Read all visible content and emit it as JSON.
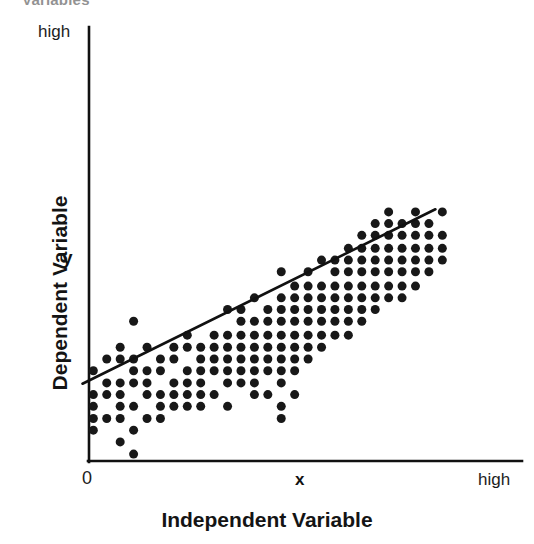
{
  "figure": {
    "clipped_title": "Variables",
    "y_top_label": "high",
    "y_mid_label": "y",
    "y_axis_title": "Dependent Variable",
    "x_zero_label": "0",
    "x_mid_label": "x",
    "x_high_label": "high",
    "x_axis_title": "Independent Variable"
  },
  "colors": {
    "point": "#181818",
    "axis": "#111111",
    "trendline": "#111111",
    "background": "#ffffff",
    "text": "#141414"
  },
  "chart_data": {
    "type": "scatter",
    "title": "Variables",
    "xlabel": "Independent Variable",
    "ylabel": "Dependent Variable",
    "xlim": [
      0,
      100
    ],
    "ylim": [
      0,
      100
    ],
    "xticks": [
      0,
      55,
      100
    ],
    "xticklabels": [
      "0",
      "x",
      "high"
    ],
    "yticks": [
      100
    ],
    "yticklabels": [
      "high"
    ],
    "grid": false,
    "legend": null,
    "annotations": [
      {
        "text": "x",
        "axis": "x",
        "position": 55,
        "bold": true
      },
      {
        "text": "y",
        "axis": "y",
        "position": 66,
        "bold": true
      }
    ],
    "trendline": {
      "type": "linear",
      "x": [
        -1.5,
        80.0
      ],
      "y": [
        17.8,
        58.0
      ],
      "slope": 0.49,
      "intercept": 18.5
    },
    "point_marker": {
      "shape": "circle",
      "size_px": 9,
      "color": "#181818"
    },
    "n_points": 173,
    "points": [
      [
        1.0,
        20.8
      ],
      [
        1.0,
        15.3
      ],
      [
        1.0,
        12.6
      ],
      [
        1.0,
        9.8
      ],
      [
        1.0,
        7.1
      ],
      [
        4.1,
        23.5
      ],
      [
        4.1,
        18.0
      ],
      [
        4.1,
        15.3
      ],
      [
        4.1,
        9.8
      ],
      [
        7.2,
        26.2
      ],
      [
        7.2,
        23.5
      ],
      [
        7.2,
        18.0
      ],
      [
        7.2,
        15.3
      ],
      [
        7.2,
        12.6
      ],
      [
        7.2,
        9.8
      ],
      [
        7.2,
        4.4
      ],
      [
        10.3,
        32.2
      ],
      [
        10.3,
        23.5
      ],
      [
        10.3,
        20.8
      ],
      [
        10.3,
        18.0
      ],
      [
        10.3,
        12.6
      ],
      [
        10.3,
        7.1
      ],
      [
        10.3,
        1.6
      ],
      [
        13.4,
        26.2
      ],
      [
        13.4,
        20.8
      ],
      [
        13.4,
        18.0
      ],
      [
        13.4,
        15.3
      ],
      [
        13.4,
        9.8
      ],
      [
        16.5,
        23.5
      ],
      [
        16.5,
        20.8
      ],
      [
        16.5,
        15.3
      ],
      [
        16.5,
        12.6
      ],
      [
        16.5,
        9.8
      ],
      [
        19.6,
        26.2
      ],
      [
        19.6,
        23.5
      ],
      [
        19.6,
        18.0
      ],
      [
        19.6,
        15.3
      ],
      [
        19.6,
        12.6
      ],
      [
        22.7,
        29.0
      ],
      [
        22.7,
        26.2
      ],
      [
        22.7,
        20.8
      ],
      [
        22.7,
        18.0
      ],
      [
        22.7,
        15.3
      ],
      [
        22.7,
        12.6
      ],
      [
        25.8,
        26.2
      ],
      [
        25.8,
        23.5
      ],
      [
        25.8,
        20.8
      ],
      [
        25.8,
        18.0
      ],
      [
        25.8,
        15.3
      ],
      [
        25.8,
        12.6
      ],
      [
        28.9,
        29.0
      ],
      [
        28.9,
        26.2
      ],
      [
        28.9,
        23.5
      ],
      [
        28.9,
        20.8
      ],
      [
        28.9,
        15.3
      ],
      [
        32.0,
        34.9
      ],
      [
        32.0,
        29.0
      ],
      [
        32.0,
        26.2
      ],
      [
        32.0,
        23.5
      ],
      [
        32.0,
        20.8
      ],
      [
        32.0,
        18.0
      ],
      [
        32.0,
        12.6
      ],
      [
        35.1,
        34.9
      ],
      [
        35.1,
        32.2
      ],
      [
        35.1,
        29.0
      ],
      [
        35.1,
        26.2
      ],
      [
        35.1,
        23.5
      ],
      [
        35.1,
        20.8
      ],
      [
        35.1,
        18.0
      ],
      [
        38.2,
        37.6
      ],
      [
        38.2,
        32.2
      ],
      [
        38.2,
        29.0
      ],
      [
        38.2,
        26.2
      ],
      [
        38.2,
        23.5
      ],
      [
        38.2,
        20.8
      ],
      [
        38.2,
        18.0
      ],
      [
        38.2,
        15.3
      ],
      [
        41.3,
        34.9
      ],
      [
        41.3,
        32.2
      ],
      [
        41.3,
        29.0
      ],
      [
        41.3,
        26.2
      ],
      [
        41.3,
        23.5
      ],
      [
        41.3,
        20.8
      ],
      [
        41.3,
        15.3
      ],
      [
        44.4,
        43.6
      ],
      [
        44.4,
        37.6
      ],
      [
        44.4,
        34.9
      ],
      [
        44.4,
        32.2
      ],
      [
        44.4,
        29.0
      ],
      [
        44.4,
        26.2
      ],
      [
        44.4,
        23.5
      ],
      [
        44.4,
        20.8
      ],
      [
        44.4,
        18.0
      ],
      [
        44.4,
        12.6
      ],
      [
        44.4,
        9.8
      ],
      [
        47.5,
        40.3
      ],
      [
        47.5,
        37.6
      ],
      [
        47.5,
        34.9
      ],
      [
        47.5,
        32.2
      ],
      [
        47.5,
        29.0
      ],
      [
        47.5,
        26.2
      ],
      [
        47.5,
        23.5
      ],
      [
        47.5,
        20.8
      ],
      [
        47.5,
        15.3
      ],
      [
        50.6,
        43.6
      ],
      [
        50.6,
        40.3
      ],
      [
        50.6,
        37.6
      ],
      [
        50.6,
        34.9
      ],
      [
        50.6,
        32.2
      ],
      [
        50.6,
        29.0
      ],
      [
        50.6,
        26.2
      ],
      [
        50.6,
        23.5
      ],
      [
        53.7,
        46.3
      ],
      [
        53.7,
        40.3
      ],
      [
        53.7,
        37.6
      ],
      [
        53.7,
        34.9
      ],
      [
        53.7,
        32.2
      ],
      [
        53.7,
        29.0
      ],
      [
        53.7,
        26.2
      ],
      [
        56.8,
        46.3
      ],
      [
        56.8,
        43.6
      ],
      [
        56.8,
        40.3
      ],
      [
        56.8,
        37.6
      ],
      [
        56.8,
        34.9
      ],
      [
        56.8,
        32.2
      ],
      [
        56.8,
        29.0
      ],
      [
        59.9,
        49.0
      ],
      [
        59.9,
        46.3
      ],
      [
        59.9,
        43.6
      ],
      [
        59.9,
        40.3
      ],
      [
        59.9,
        37.6
      ],
      [
        59.9,
        34.9
      ],
      [
        59.9,
        32.2
      ],
      [
        59.9,
        29.0
      ],
      [
        63.0,
        52.0
      ],
      [
        63.0,
        49.0
      ],
      [
        63.0,
        46.3
      ],
      [
        63.0,
        43.6
      ],
      [
        63.0,
        40.3
      ],
      [
        63.0,
        37.6
      ],
      [
        63.0,
        34.9
      ],
      [
        63.0,
        32.2
      ],
      [
        66.1,
        54.7
      ],
      [
        66.1,
        52.0
      ],
      [
        66.1,
        49.0
      ],
      [
        66.1,
        46.3
      ],
      [
        66.1,
        43.6
      ],
      [
        66.1,
        40.3
      ],
      [
        66.1,
        37.6
      ],
      [
        66.1,
        34.9
      ],
      [
        69.2,
        57.4
      ],
      [
        69.2,
        54.7
      ],
      [
        69.2,
        52.0
      ],
      [
        69.2,
        49.0
      ],
      [
        69.2,
        46.3
      ],
      [
        69.2,
        43.6
      ],
      [
        69.2,
        40.3
      ],
      [
        69.2,
        37.6
      ],
      [
        72.3,
        54.7
      ],
      [
        72.3,
        52.0
      ],
      [
        72.3,
        49.0
      ],
      [
        72.3,
        46.3
      ],
      [
        72.3,
        43.6
      ],
      [
        72.3,
        40.3
      ],
      [
        72.3,
        37.6
      ],
      [
        75.4,
        57.4
      ],
      [
        75.4,
        54.7
      ],
      [
        75.4,
        52.0
      ],
      [
        75.4,
        49.0
      ],
      [
        75.4,
        46.3
      ],
      [
        75.4,
        43.6
      ],
      [
        75.4,
        40.3
      ],
      [
        78.5,
        54.7
      ],
      [
        78.5,
        52.0
      ],
      [
        78.5,
        49.0
      ],
      [
        78.5,
        46.3
      ],
      [
        78.5,
        43.6
      ],
      [
        81.6,
        57.4
      ],
      [
        81.6,
        52.0
      ],
      [
        81.6,
        49.0
      ],
      [
        81.6,
        46.3
      ]
    ]
  }
}
